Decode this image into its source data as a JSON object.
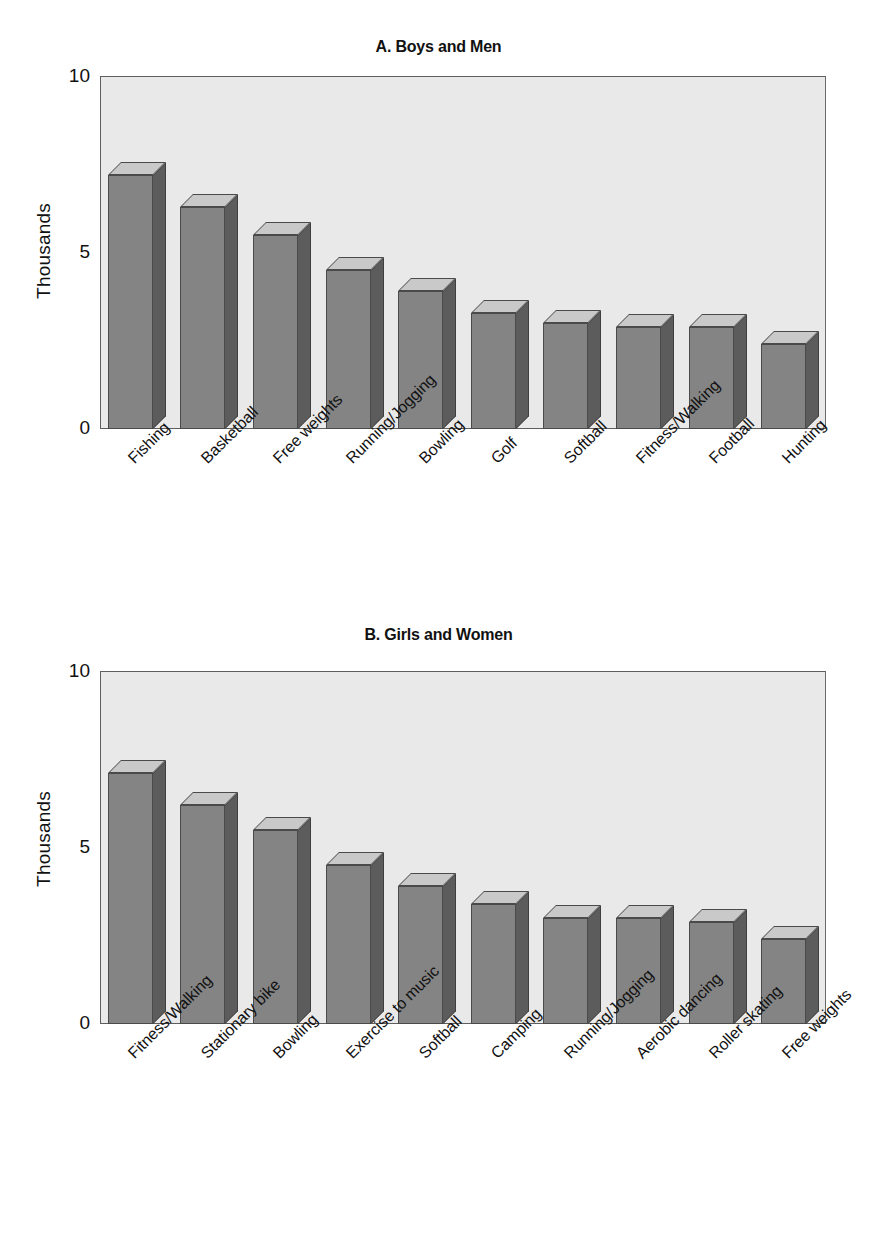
{
  "figure": {
    "background_color": "#ffffff",
    "plot_background_color": "#e9e9e9",
    "bar_face_color": "#848484",
    "bar_side_color": "#5c5c5c",
    "bar_top_color": "#c9c9c9",
    "axis_color": "#5e5e5e"
  },
  "chart_data": [
    {
      "type": "bar",
      "title": "A. Boys and Men",
      "xlabel": "",
      "ylabel": "Thousands",
      "ylim": [
        0,
        10
      ],
      "yticks": [
        0,
        5,
        10
      ],
      "ytick_labels": [
        "0",
        "5",
        "10"
      ],
      "grid": false,
      "legend": "none",
      "three_d": true,
      "categories": [
        "Fishing",
        "Basketball",
        "Free weights",
        "Running/Jogging",
        "Bowling",
        "Golf",
        "Softball",
        "Fitness/Walking",
        "Football",
        "Hunting"
      ],
      "values": [
        7.2,
        6.3,
        5.5,
        4.5,
        3.9,
        3.3,
        3.0,
        2.9,
        2.9,
        2.4
      ]
    },
    {
      "type": "bar",
      "title": "B. Girls and Women",
      "xlabel": "",
      "ylabel": "Thousands",
      "ylim": [
        0,
        10
      ],
      "yticks": [
        0,
        5,
        10
      ],
      "ytick_labels": [
        "0",
        "5",
        "10"
      ],
      "grid": false,
      "legend": "none",
      "three_d": true,
      "categories": [
        "Fitness/Walking",
        "Stationary bike",
        "Bowling",
        "Exercise to music",
        "Softball",
        "Camping",
        "Running/Jogging",
        "Aerobic dancing",
        "Roller skating",
        "Free weights"
      ],
      "values": [
        7.1,
        6.2,
        5.5,
        4.5,
        3.9,
        3.4,
        3.0,
        3.0,
        2.9,
        2.4
      ]
    }
  ],
  "panel_a": {
    "title": "A. Boys and Men",
    "ylabel": "Thousands",
    "ytick_0": "0",
    "ytick_5": "5",
    "ytick_10": "10"
  },
  "panel_b": {
    "title": "B. Girls and Women",
    "ylabel": "Thousands",
    "ytick_0": "0",
    "ytick_5": "5",
    "ytick_10": "10"
  }
}
